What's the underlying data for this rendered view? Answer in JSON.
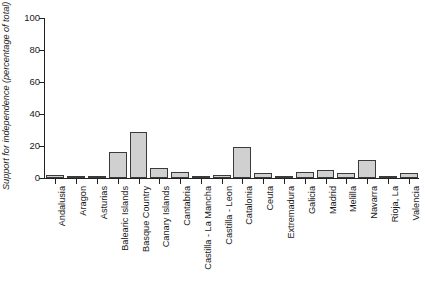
{
  "chart_data": {
    "type": "bar",
    "title": "",
    "xlabel": "",
    "ylabel": "Support for independence (percentage of total)",
    "ylim": [
      0,
      100
    ],
    "yticks": [
      0,
      20,
      40,
      60,
      80,
      100
    ],
    "grid": false,
    "legend": null,
    "categories": [
      "Andalusia",
      "Aragon",
      "Asturias",
      "Balearic Islands",
      "Basque Country",
      "Canary Islands",
      "Cantabria",
      "Castilla - La Mancha",
      "Castilla - Leon",
      "Catalonia",
      "Ceuta",
      "Extremadura",
      "Galicia",
      "Madrid",
      "Melilla",
      "Navarra",
      "Rioja, La",
      "Valencia"
    ],
    "values": [
      2,
      0,
      0,
      16.5,
      28.5,
      6,
      4,
      0,
      2,
      19.5,
      3,
      0,
      4,
      5,
      3,
      11,
      1,
      3
    ],
    "bar_fill_color": "#d0d0d0",
    "bar_edge_color": "#3a3a3a",
    "axis_color": "#222222",
    "background_color": "#ffffff"
  }
}
